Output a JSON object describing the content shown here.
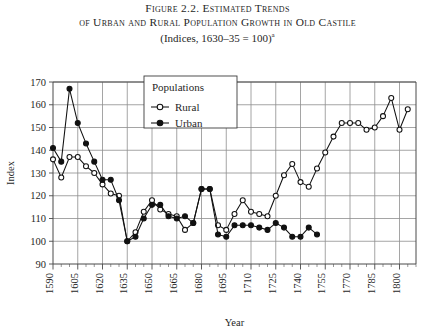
{
  "figure": {
    "title_line1": "Figure 2.2. Estimated Trends",
    "title_line2": "of Urban and Rural Population Growth in Old Castile",
    "subtitle": "(Indices, 1630–35 = 100)",
    "subtitle_footnote_marker": "a"
  },
  "axes": {
    "x_title": "Year",
    "y_title": "Index",
    "x_tick_labels": [
      "1590",
      "1605",
      "1620",
      "1635",
      "1650",
      "1665",
      "1680",
      "1695",
      "1710",
      "1725",
      "1740",
      "1755",
      "1770",
      "1785",
      "1800"
    ],
    "y_tick_labels": [
      "90",
      "100",
      "110",
      "120",
      "130",
      "140",
      "150",
      "160",
      "170"
    ]
  },
  "legend": {
    "title": "Populations",
    "entries": [
      {
        "label": "Rural",
        "marker": "open-circle-icon",
        "color": "#111111"
      },
      {
        "label": "Urban",
        "marker": "filled-circle-icon",
        "color": "#111111"
      }
    ]
  },
  "chart_data": {
    "type": "line",
    "title": "Figure 2.2. Estimated Trends of Urban and Rural Population Growth in Old Castile",
    "subtitle": "(Indices, 1630–35 = 100)",
    "xlabel": "Year",
    "ylabel": "Index",
    "xlim": [
      1590,
      1810
    ],
    "ylim": [
      90,
      170
    ],
    "xticks": [
      1590,
      1605,
      1620,
      1635,
      1650,
      1665,
      1680,
      1695,
      1710,
      1725,
      1740,
      1755,
      1770,
      1785,
      1800
    ],
    "xtick_minor_step": 5,
    "yticks": [
      90,
      100,
      110,
      120,
      130,
      140,
      150,
      160,
      170
    ],
    "grid": "both",
    "legend_position": "top-center",
    "series": [
      {
        "name": "Rural",
        "marker": "open-circle",
        "color": "#111111",
        "x": [
          1590,
          1595,
          1600,
          1605,
          1610,
          1615,
          1620,
          1625,
          1630,
          1635,
          1640,
          1645,
          1650,
          1655,
          1660,
          1665,
          1670,
          1675,
          1680,
          1685,
          1690,
          1695,
          1700,
          1705,
          1710,
          1715,
          1720,
          1725,
          1730,
          1735,
          1740,
          1745,
          1750,
          1755,
          1760,
          1765,
          1770,
          1775,
          1780,
          1785,
          1790,
          1795,
          1800,
          1805
        ],
        "values": [
          136,
          128,
          137,
          137,
          133,
          130,
          125,
          121,
          120,
          100,
          104,
          113,
          118,
          114,
          112,
          111,
          105,
          108,
          123,
          123,
          107,
          105,
          112,
          118,
          113,
          112,
          111,
          120,
          129,
          134,
          126,
          124,
          132,
          139,
          146,
          152,
          152,
          152,
          149,
          150,
          155,
          163,
          149,
          158
        ]
      },
      {
        "name": "Urban",
        "marker": "filled-circle",
        "color": "#111111",
        "x": [
          1590,
          1595,
          1600,
          1605,
          1610,
          1615,
          1620,
          1625,
          1630,
          1635,
          1640,
          1645,
          1650,
          1655,
          1660,
          1665,
          1670,
          1675,
          1680,
          1685,
          1690,
          1695,
          1700,
          1705,
          1710,
          1715,
          1720,
          1725,
          1730,
          1735,
          1740,
          1745,
          1750
        ],
        "values": [
          141,
          135,
          167,
          152,
          143,
          135,
          127,
          127,
          118,
          100,
          102,
          110,
          116,
          116,
          111,
          110,
          111,
          108,
          123,
          123,
          103,
          102,
          107,
          107,
          107,
          106,
          105,
          108,
          106,
          102,
          102,
          106,
          103
        ]
      }
    ]
  }
}
